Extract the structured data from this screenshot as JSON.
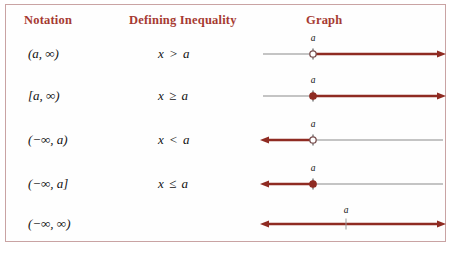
{
  "figure": {
    "border_color": "#c9a3a3",
    "background": "#fefefe",
    "header_color": "#a63a32",
    "line_gray": "#8a8a8a",
    "line_red": "#8f2b22",
    "headers": {
      "notation": "Notation",
      "inequality": "Defining Inequality",
      "graph": "Graph"
    },
    "rows": [
      {
        "notation": "(a, ∞)",
        "inequality": "x > a",
        "point_label": "a",
        "endpoint": "open",
        "direction": "right",
        "point_x": 54
      },
      {
        "notation": "[a, ∞)",
        "inequality": "x ≥ a",
        "point_label": "a",
        "endpoint": "closed",
        "direction": "right",
        "point_x": 54
      },
      {
        "notation": "(−∞, a)",
        "inequality": "x < a",
        "point_label": "a",
        "endpoint": "open",
        "direction": "left",
        "point_x": 54
      },
      {
        "notation": "(−∞, a]",
        "inequality": "x ≤ a",
        "point_label": "a",
        "endpoint": "closed",
        "direction": "left",
        "point_x": 54
      },
      {
        "notation": "(−∞, ∞)",
        "inequality": "",
        "point_label": "a",
        "endpoint": "tick",
        "direction": "both",
        "point_x": 87
      }
    ]
  }
}
